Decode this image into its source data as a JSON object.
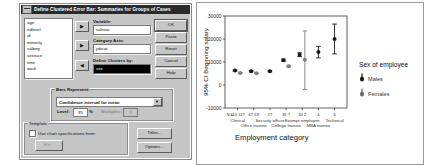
{
  "dialog": {
    "title": "Define Clustered Error Bar: Summaries for Groups of Cases",
    "sysmenu_icon": "system-menu-icon",
    "variable_list": [
      "age",
      "edlevel",
      "id",
      "minority",
      "salbeg",
      "sexrace",
      "time",
      "work"
    ],
    "arrow_glyph": "▶",
    "arrow_glyph_left": "◀",
    "fields": [
      {
        "label": "Variable:",
        "value": "salnow"
      },
      {
        "label": "Category Axis:",
        "value": "jobcat"
      },
      {
        "label": "Define Clusters by:",
        "value": "sex"
      }
    ],
    "buttons": {
      "ok": "OK",
      "paste": "Paste",
      "reset": "Reset",
      "cancel": "Cancel",
      "help": "Help",
      "titles": "Titles...",
      "options": "Options...",
      "file": "File..."
    },
    "bars_represent": {
      "legend": "Bars Represent",
      "selected": "Confidence interval for mean",
      "dropdown_glyph": "▼",
      "level_label": "Level:",
      "level_value": "95",
      "percent_sign": "%",
      "multiplier_label": "Multiplier:",
      "multiplier_value": "2"
    },
    "template": {
      "legend": "Template",
      "checkbox_label": "Use chart specifications from:",
      "checked": false
    }
  },
  "chart_data": {
    "type": "scatter",
    "title": "",
    "xlabel": "Employment category",
    "ylabel": "95% CI Beginning salary",
    "ylim": [
      -10000,
      30000
    ],
    "yticks": [
      -10000,
      0,
      10000,
      20000,
      30000
    ],
    "ytick_labels": [
      "-10000",
      "0",
      "10000",
      "20000",
      "30000"
    ],
    "grid": false,
    "legend_title": "Sex of employee",
    "legend_position": "right",
    "legend_entries": [
      "Males",
      "Females"
    ],
    "n_prefix": "N =",
    "categories": [
      "Clerical",
      "Office trainee",
      "Security officer",
      "College trainee",
      "Exempt employee",
      "MBA trainee",
      "Technical"
    ],
    "n_labels": [
      "110  117",
      "67  69",
      "27",
      "36  7",
      "30  2",
      "4",
      "6"
    ],
    "series": [
      {
        "name": "Males",
        "values": [
          6300,
          6000,
          6000,
          10800,
          13200,
          14300,
          20000
        ],
        "ci_low": [
          6000,
          5700,
          5700,
          10300,
          12400,
          11800,
          13500
        ],
        "ci_high": [
          6600,
          6300,
          6300,
          11300,
          14000,
          16800,
          26500
        ]
      },
      {
        "name": "Females",
        "values": [
          5200,
          5150,
          null,
          8200,
          11000,
          null,
          null
        ],
        "ci_low": [
          5050,
          5000,
          null,
          7900,
          -2000,
          null,
          null
        ],
        "ci_high": [
          5350,
          5300,
          null,
          8500,
          23500,
          null,
          null
        ]
      }
    ]
  }
}
